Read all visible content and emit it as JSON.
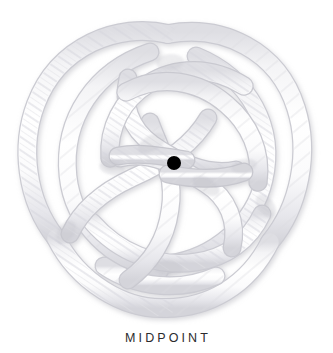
{
  "page": {
    "background_color": "#ffffff",
    "width": 333,
    "height": 353
  },
  "caption": {
    "text": "MIDPOINT",
    "color": "#2b2b2d"
  },
  "figure": {
    "rope_color": "#ffffff",
    "rope_shade_color": "#e3e3e6",
    "rope_shadow_color": "#cfcfd4",
    "rope_strand_color": "#d8d8dd",
    "marker": {
      "label": "midpoint-marker",
      "color": "#000000",
      "center_x": 174,
      "center_y": 163,
      "radius": 7
    },
    "bounds": {
      "left": 22,
      "top": 25,
      "right": 306,
      "bottom": 313
    }
  }
}
